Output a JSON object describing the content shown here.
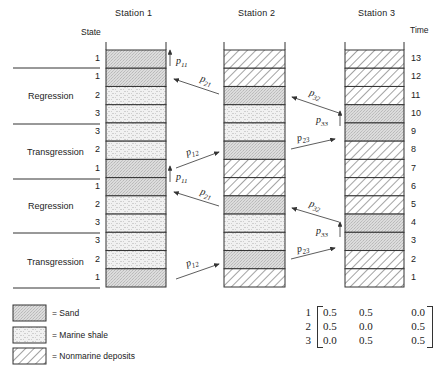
{
  "headers": {
    "station1": "Station 1",
    "station2": "Station 2",
    "station3": "Station 3",
    "state": "State",
    "time": "Time"
  },
  "phases": [
    {
      "label": "Regression"
    },
    {
      "label": "Transgression"
    },
    {
      "label": "Regression"
    },
    {
      "label": "Transgression"
    }
  ],
  "time_labels": [
    "13",
    "12",
    "11",
    "10",
    "9",
    "8",
    "7",
    "6",
    "5",
    "4",
    "3",
    "2",
    "1"
  ],
  "station1_states": [
    "1",
    "1",
    "2",
    "3",
    "3",
    "2",
    "1",
    "1",
    "2",
    "3",
    "3",
    "2",
    "1"
  ],
  "stations": {
    "station1": [
      "sand",
      "sand",
      "shale",
      "shale",
      "shale",
      "shale",
      "sand",
      "sand",
      "shale",
      "shale",
      "shale",
      "shale",
      "sand"
    ],
    "station2": [
      "hatch",
      "hatch",
      "sand",
      "shale",
      "shale",
      "sand",
      "hatch",
      "hatch",
      "sand",
      "shale",
      "shale",
      "sand",
      "hatch"
    ],
    "station3": [
      "hatch",
      "hatch",
      "hatch",
      "sand",
      "sand",
      "hatch",
      "hatch",
      "hatch",
      "hatch",
      "sand",
      "sand",
      "hatch",
      "hatch"
    ]
  },
  "transitions": [
    {
      "label": "p",
      "sub": "11"
    },
    {
      "label": "p",
      "sub": "21"
    },
    {
      "label": "p",
      "sub": "12"
    },
    {
      "label": "p",
      "sub": "11"
    },
    {
      "label": "p",
      "sub": "21"
    },
    {
      "label": "p",
      "sub": "12"
    },
    {
      "label": "p",
      "sub": "32"
    },
    {
      "label": "p",
      "sub": "33"
    },
    {
      "label": "p",
      "sub": "23"
    },
    {
      "label": "p",
      "sub": "32"
    },
    {
      "label": "p",
      "sub": "33"
    },
    {
      "label": "p",
      "sub": "23"
    }
  ],
  "legend": [
    {
      "pattern": "sand",
      "label": "= Sand"
    },
    {
      "pattern": "shale",
      "label": "= Marine shale"
    },
    {
      "pattern": "hatch",
      "label": "= Nonmarine deposits"
    }
  ],
  "matrix": {
    "row_labels": [
      "1",
      "2",
      "3"
    ],
    "rows": [
      [
        "0.5",
        "0.5",
        "0.0"
      ],
      [
        "0.5",
        "0.0",
        "0.5"
      ],
      [
        "0.0",
        "0.5",
        "0.5"
      ]
    ]
  },
  "colors": {
    "sand": "#d9d9d9",
    "shale": "#eeeeee",
    "line": "#333333"
  }
}
